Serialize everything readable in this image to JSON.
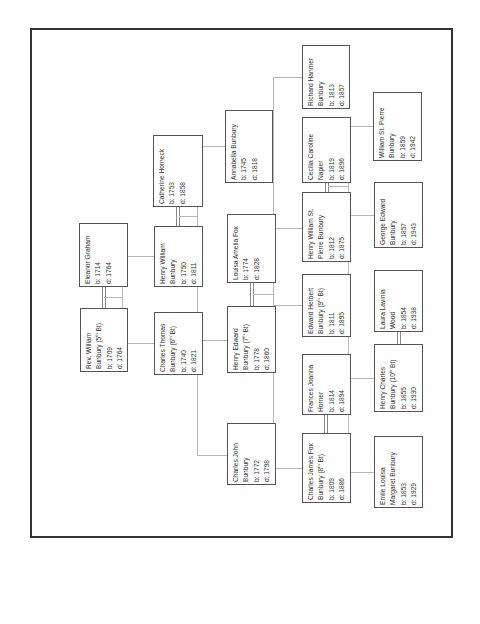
{
  "orientation": "rotated-90-ccw",
  "colors": {
    "box_border": "#555555",
    "connector": "#b8b8b8",
    "frame": "#333333",
    "text": "#333333"
  },
  "people": {
    "rev_william": {
      "name1": "Rev, William",
      "name2": "Bunbury (5th Bt)",
      "born": "b: 1709",
      "died": "d: 1764"
    },
    "eleanor_graham": {
      "name1": "Eleanor Graham",
      "born": "b: 1714",
      "died": "d: 1764"
    },
    "charles_thomas": {
      "name1": "Charles Thomas",
      "name2": "Bunbury (6th Bt)",
      "born": "b: 1740",
      "died": "d: 1821"
    },
    "henry_william": {
      "name1": "Henry William",
      "name2": "Bunbury",
      "born": "b: 1750",
      "died": "d: 1811"
    },
    "catherine_horneck": {
      "name1": "Catherine Horneck",
      "born": "b: 1753",
      "died": "d: 1858"
    },
    "annabella": {
      "name1": "Annabella Bunbury",
      "born": "b: 1745",
      "died": "d: 1818"
    },
    "louisa_amelia": {
      "name1": "Louisa Amelia Fox",
      "born": "b: 1774",
      "died": "d: 1828"
    },
    "henry_edward": {
      "name1": "Henry Edward",
      "name2": "Bunbury (7th Bt)",
      "born": "b: 1778",
      "died": "d: 1860"
    },
    "charles_john": {
      "name1": "Charles John",
      "name2": "Bunbury",
      "born": "b: 1772",
      "died": "d: 1798"
    },
    "richard_hanmer": {
      "name1": "Richard Hanmer",
      "name2": "Bunbury",
      "born": "b: 1813",
      "died": "d: 1857"
    },
    "cecilia_caroline": {
      "name1": "Cecilia Caroline",
      "name2": "Napier",
      "born": "b: 1819",
      "died": "d: 1896"
    },
    "henry_william_st_pierre": {
      "name1": "Henry William St.",
      "name2": "Pierre Bunbury",
      "born": "b: 1812",
      "died": "d: 1875"
    },
    "edward_herbert": {
      "name1": "Edward Herbert",
      "name2": "Bunbury (9th Bt)",
      "born": "b: 1811",
      "died": "d: 1895"
    },
    "frances_joanna": {
      "name1": "Frances Joanna",
      "name2": "Horner",
      "born": "b: 1814",
      "died": "d: 1894"
    },
    "charles_james_fox": {
      "name1": "Charles James Fox",
      "name2": "Bunbury (8th Bt)",
      "born": "b: 1809",
      "died": "d: 1886"
    },
    "william_st_pierre": {
      "name1": "William St. Pierre",
      "name2": "Bunbury",
      "born": "b: 1859",
      "died": "d: 1942"
    },
    "george_edward": {
      "name1": "George Edward",
      "name2": "Bunbury",
      "born": "b: 1857",
      "died": "d: 1943"
    },
    "laura_lavinia": {
      "name1": "Laura Lavinia",
      "name2": "Wood",
      "born": "b: 1854",
      "died": "d: 1938"
    },
    "henry_charles": {
      "name1": "Henry Charles",
      "name2": "Bunbury (10th Bt)",
      "born": "b: 1855",
      "died": "d: 1930"
    },
    "emile_louisa": {
      "name1": "Emile Louisa",
      "name2": "Margaret Bunbury",
      "born": "b: 1853",
      "died": "d: 1929"
    }
  }
}
